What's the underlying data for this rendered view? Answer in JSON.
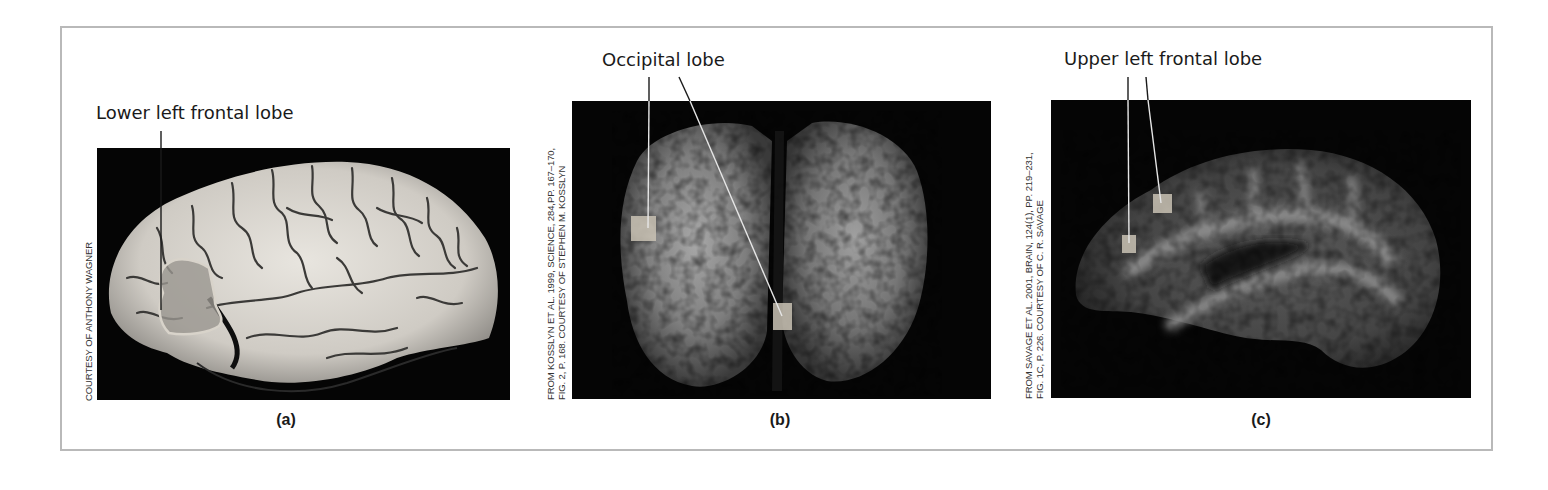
{
  "figure": {
    "panels": [
      {
        "id": "a",
        "caption": "(a)",
        "label": "Lower left frontal lobe",
        "credit_lines": [
          "COURTESY OF ANTHONY WAGNER"
        ],
        "image": "Lateral view photograph of human brain (left hemisphere) with highlighted region"
      },
      {
        "id": "b",
        "caption": "(b)",
        "label": "Occipital lobe",
        "credit_lines": [
          "FROM KOSSLYN ET AL. 1999, SCIENCE, 284,PP. 167–170,",
          "FIG. 2, P. 168. COURTESY OF STEPHEN M. KOSSLYN"
        ],
        "credit_journal": "SCIENCE",
        "image": "Brain scan (posterior/coronal view) with two highlighted activation regions"
      },
      {
        "id": "c",
        "caption": "(c)",
        "label": "Upper left frontal lobe",
        "credit_lines": [
          "FROM SAVAGE ET AL. 2001, BRAIN, 124(1), PP. 219–231,",
          "FIG. 1C, P. 226. COURTESY OF C. R. SAVAGE"
        ],
        "credit_journal": "BRAIN",
        "image": "Sagittal brain scan with two highlighted activation regions"
      }
    ],
    "colors": {
      "frame_border": "#b9b9b9",
      "image_background": "#050505",
      "text": "#1a1a1a",
      "marker_fill": "#c9c2b4"
    }
  }
}
